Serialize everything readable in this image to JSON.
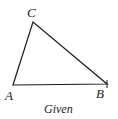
{
  "diagram": {
    "vertices": {
      "A": {
        "label": "A",
        "x": 13,
        "y": 85
      },
      "B": {
        "label": "B",
        "x": 107,
        "y": 84
      },
      "C": {
        "label": "C",
        "x": 33,
        "y": 22
      }
    },
    "caption": "Given",
    "stroke_color": "#1a1a1a"
  }
}
